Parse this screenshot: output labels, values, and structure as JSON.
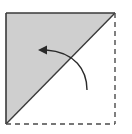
{
  "diagram": {
    "type": "origami-fold-step",
    "colors": {
      "background": "#ffffff",
      "paper_fill": "#cfcfcf",
      "line": "#3a3a3a",
      "dashed_line": "#4a4a4a",
      "arrow": "#2a2a2a"
    },
    "square": {
      "x1": 6,
      "y1": 13,
      "x2": 115,
      "y2": 124
    },
    "shaded_triangle": {
      "points": [
        [
          6,
          13
        ],
        [
          115,
          13
        ],
        [
          6,
          124
        ]
      ]
    },
    "fold_line": {
      "from": [
        6,
        124
      ],
      "to": [
        115,
        13
      ],
      "style": "solid"
    },
    "dashed_edges": [
      {
        "from": [
          115,
          13
        ],
        "to": [
          115,
          124
        ]
      },
      {
        "from": [
          6,
          124
        ],
        "to": [
          115,
          124
        ]
      }
    ],
    "arrow": {
      "start": [
        87,
        90
      ],
      "end": [
        40,
        50
      ],
      "direction": "counter-clockwise, up and left",
      "head": "filled"
    }
  }
}
